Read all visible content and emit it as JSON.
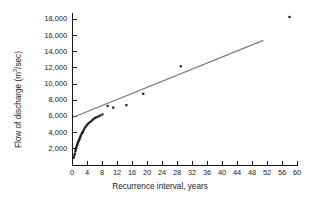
{
  "chart_data": {
    "type": "scatter",
    "title": "",
    "xlabel": "Recurrence interval, years",
    "ylabel_plain": "Flow of discharge (m3/sec)",
    "ylabel_prefix": "Flow of discharge (m",
    "ylabel_sup": "3",
    "ylabel_suffix": "/sec)",
    "xlim": [
      0,
      60
    ],
    "ylim": [
      0,
      19000
    ],
    "xticks": [
      0,
      4,
      8,
      12,
      16,
      20,
      24,
      28,
      32,
      36,
      40,
      44,
      48,
      52,
      56,
      60
    ],
    "xtick_labels": [
      "0",
      "4",
      "8",
      "12",
      "16",
      "20",
      "24",
      "28",
      "32",
      "36",
      "40",
      "44",
      "48",
      "52",
      "56",
      "60"
    ],
    "yticks": [
      2000,
      4000,
      6000,
      8000,
      10000,
      12000,
      14000,
      16000,
      18000
    ],
    "ytick_labels": [
      "2,000",
      "4,000",
      "6,000",
      "8,000",
      "10,000",
      "12,000",
      "14,000",
      "16,000",
      "18,000"
    ],
    "grid": false,
    "legend": "none",
    "marker_color": "#1a1a1a",
    "trendline_color": "#7a7a7a",
    "axis_color": "#1a1a1a",
    "x": [
      0.45,
      0.6,
      0.75,
      0.9,
      1.0,
      1.1,
      1.25,
      1.4,
      1.5,
      1.6,
      1.75,
      1.9,
      2.0,
      2.15,
      2.3,
      2.5,
      2.7,
      2.9,
      3.1,
      3.3,
      3.6,
      3.9,
      4.2,
      4.5,
      4.9,
      5.3,
      5.7,
      6.1,
      6.5,
      7.0,
      7.5,
      8.1,
      9.5,
      11.0,
      14.5,
      19.0,
      29.0,
      58.0
    ],
    "y": [
      900,
      1150,
      1400,
      1700,
      1900,
      2100,
      2300,
      2500,
      2650,
      2800,
      2950,
      3100,
      3250,
      3400,
      3600,
      3800,
      3950,
      4100,
      4300,
      4500,
      4700,
      4900,
      5050,
      5200,
      5350,
      5500,
      5650,
      5800,
      5900,
      6000,
      6100,
      6250,
      7300,
      7100,
      7400,
      8800,
      12200,
      18300
    ],
    "trendline": {
      "x0": 0.3,
      "y0": 5900,
      "x1": 51.0,
      "y1": 15400
    }
  }
}
